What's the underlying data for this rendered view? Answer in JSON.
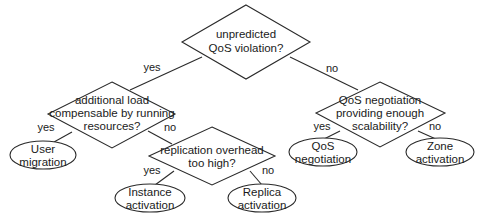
{
  "diagram": {
    "type": "decision-tree",
    "nodes": {
      "root": {
        "kind": "decision",
        "lines": [
          "unpredicted",
          "QoS violation?"
        ]
      },
      "left": {
        "kind": "decision",
        "lines": [
          "additional load",
          "compensable by running",
          "resources?"
        ]
      },
      "right": {
        "kind": "decision",
        "lines": [
          "QoS negotiation",
          "providing enough",
          "scalability?"
        ]
      },
      "replication": {
        "kind": "decision",
        "lines": [
          "replication overhead",
          "too high?"
        ]
      },
      "user_migration": {
        "kind": "outcome",
        "lines": [
          "User",
          "migration"
        ]
      },
      "qos_negotiation": {
        "kind": "outcome",
        "lines": [
          "QoS",
          "negotiation"
        ]
      },
      "zone_activation": {
        "kind": "outcome",
        "lines": [
          "Zone",
          "activation"
        ]
      },
      "instance_activation": {
        "kind": "outcome",
        "lines": [
          "Instance",
          "activation"
        ]
      },
      "replica_activation": {
        "kind": "outcome",
        "lines": [
          "Replica",
          "activation"
        ]
      }
    },
    "edges": {
      "root_left": {
        "from": "root",
        "to": "left",
        "label": "yes"
      },
      "root_right": {
        "from": "root",
        "to": "right",
        "label": "no"
      },
      "left_user": {
        "from": "left",
        "to": "user_migration",
        "label": "yes"
      },
      "left_repl": {
        "from": "left",
        "to": "replication",
        "label": "no"
      },
      "right_qos": {
        "from": "right",
        "to": "qos_negotiation",
        "label": "yes"
      },
      "right_zone": {
        "from": "right",
        "to": "zone_activation",
        "label": "no"
      },
      "repl_instance": {
        "from": "replication",
        "to": "instance_activation",
        "label": "yes"
      },
      "repl_replica": {
        "from": "replication",
        "to": "replica_activation",
        "label": "no"
      }
    }
  }
}
